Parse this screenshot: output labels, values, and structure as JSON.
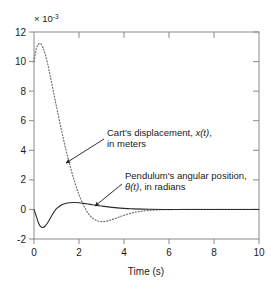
{
  "figure": {
    "background": "#ffffff",
    "frame_color": "#8a8a8a",
    "exponent_prefix": "× 10",
    "exponent_power": "-3"
  },
  "chart_data": {
    "type": "line",
    "title": "",
    "xlabel": "Time (s)",
    "ylabel": "",
    "y_exponent": "× 10^-3",
    "xlim": [
      0,
      10
    ],
    "ylim": [
      -2,
      12
    ],
    "xticks": [
      0,
      2,
      4,
      6,
      8,
      10
    ],
    "xtick_labels": [
      "0",
      "2",
      "4",
      "6",
      "8",
      "10"
    ],
    "yticks": [
      -2,
      0,
      2,
      4,
      6,
      8,
      10,
      12
    ],
    "ytick_labels": [
      "-2",
      "0",
      "2",
      "4",
      "6",
      "8",
      "10",
      "12"
    ],
    "grid": false,
    "legend_position": "none",
    "series": [
      {
        "name": "Cart's displacement, x(t), in meters",
        "style": "dotted",
        "color": "#6e6e6e",
        "x": [
          0.0,
          0.1,
          0.2,
          0.3,
          0.4,
          0.5,
          0.6,
          0.7,
          0.8,
          0.9,
          1.0,
          1.2,
          1.4,
          1.6,
          1.8,
          2.0,
          2.2,
          2.4,
          2.6,
          2.8,
          3.0,
          3.2,
          3.4,
          3.6,
          3.8,
          4.0,
          4.3,
          4.6,
          5.0,
          5.5,
          6.0,
          7.0,
          8.0,
          9.0,
          10.0
        ],
        "y": [
          10.0,
          10.85,
          11.18,
          11.2,
          10.95,
          10.5,
          9.9,
          9.2,
          8.45,
          7.7,
          6.95,
          5.5,
          4.15,
          2.95,
          1.9,
          1.0,
          0.3,
          -0.25,
          -0.58,
          -0.76,
          -0.82,
          -0.8,
          -0.72,
          -0.62,
          -0.5,
          -0.4,
          -0.26,
          -0.16,
          -0.08,
          -0.03,
          -0.01,
          0.0,
          0.0,
          0.0,
          0.0
        ]
      },
      {
        "name": "Pendulum's angular position, θ(t), in radians",
        "style": "solid",
        "color": "#2b2b2b",
        "x": [
          0.0,
          0.1,
          0.2,
          0.3,
          0.4,
          0.5,
          0.6,
          0.7,
          0.8,
          0.9,
          1.0,
          1.2,
          1.4,
          1.6,
          1.8,
          2.0,
          2.2,
          2.5,
          2.8,
          3.0,
          3.3,
          3.6,
          4.0,
          4.4,
          4.8,
          5.2,
          5.8,
          6.5,
          7.5,
          8.5,
          10.0
        ],
        "y": [
          0.0,
          -0.45,
          -0.92,
          -1.17,
          -1.22,
          -1.12,
          -0.92,
          -0.66,
          -0.4,
          -0.15,
          0.05,
          0.28,
          0.4,
          0.45,
          0.47,
          0.45,
          0.41,
          0.34,
          0.27,
          0.23,
          0.17,
          0.12,
          0.07,
          0.04,
          0.02,
          0.01,
          0.0,
          0.0,
          0.0,
          0.0,
          0.0
        ]
      }
    ],
    "annotations": [
      {
        "id": "cart-displacement",
        "line1_pre": "Cart's displacement, ",
        "line1_italic": "x(t)",
        "line1_post": ",",
        "line2": "in meters",
        "arrow_from": [
          104,
          139
        ],
        "arrow_to": [
          65,
          164
        ]
      },
      {
        "id": "pendulum-angle",
        "line1": "Pendulum's angular position,",
        "line2_italic": "θ(t)",
        "line2_post": ", in radians",
        "arrow_from": [
          122,
          182
        ],
        "arrow_to": [
          94,
          207
        ]
      }
    ]
  }
}
